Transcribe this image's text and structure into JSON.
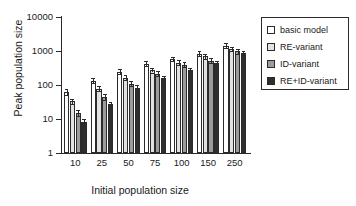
{
  "chart_data": {
    "type": "bar",
    "title": "",
    "xlabel": "Initial population size",
    "ylabel": "Peak population size",
    "categories": [
      "10",
      "25",
      "50",
      "75",
      "100",
      "150",
      "250"
    ],
    "yscale": "log",
    "ylim": [
      1,
      10000
    ],
    "yticks": [
      "1",
      "10",
      "100",
      "1000",
      "10000"
    ],
    "ytick_values": [
      1,
      10,
      100,
      1000,
      10000
    ],
    "grid": false,
    "legend_position": "right",
    "error_bars": true,
    "series": [
      {
        "name": "basic model",
        "color": "#ffffff",
        "values": [
          62,
          135,
          245,
          420,
          580,
          840,
          1450
        ],
        "errors_low": [
          12,
          22,
          38,
          65,
          85,
          120,
          210
        ],
        "errors_high": [
          14,
          25,
          42,
          72,
          95,
          135,
          240
        ]
      },
      {
        "name": "RE-variant",
        "color": "#e2e2e2",
        "values": [
          33,
          78,
          165,
          275,
          455,
          700,
          1150
        ],
        "errors_low": [
          6,
          13,
          26,
          42,
          68,
          100,
          170
        ],
        "errors_high": [
          7,
          15,
          29,
          47,
          75,
          112,
          190
        ]
      },
      {
        "name": "ID-variant",
        "color": "#9c9c9c",
        "values": [
          15,
          44,
          110,
          215,
          395,
          520,
          990
        ],
        "errors_low": [
          3,
          8,
          18,
          34,
          60,
          78,
          150
        ],
        "errors_high": [
          3.5,
          9,
          20,
          38,
          66,
          86,
          165
        ]
      },
      {
        "name": "RE+ID-variant",
        "color": "#2e2e2e",
        "values": [
          8,
          27,
          82,
          160,
          270,
          450,
          880
        ],
        "errors_low": [
          1.6,
          5,
          14,
          25,
          42,
          68,
          135
        ],
        "errors_high": [
          1.8,
          5.5,
          15,
          28,
          46,
          75,
          150
        ]
      }
    ]
  },
  "legend": {
    "items": [
      {
        "label": "basic model",
        "swatch": "#ffffff"
      },
      {
        "label": "RE-variant",
        "swatch": "#e2e2e2"
      },
      {
        "label": "ID-variant",
        "swatch": "#9c9c9c"
      },
      {
        "label": "RE+ID-variant",
        "swatch": "#2e2e2e"
      }
    ]
  }
}
